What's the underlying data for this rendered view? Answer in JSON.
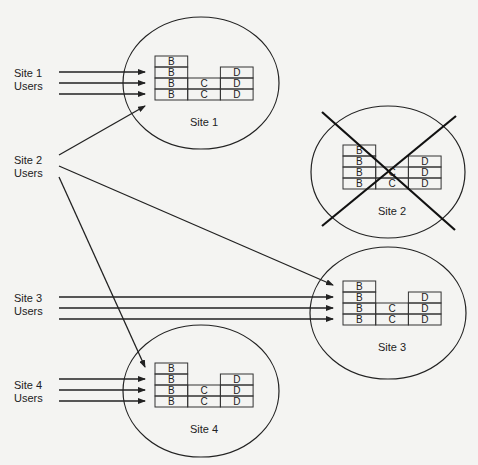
{
  "diagram": {
    "title": "",
    "sites": [
      {
        "id": "site1",
        "label": "Site 1",
        "cx": 201,
        "cy": 83,
        "rx": 78,
        "ry": 66,
        "bx": 155,
        "by": 56,
        "failed": false
      },
      {
        "id": "site2",
        "label": "Site 2",
        "cx": 388,
        "cy": 172,
        "rx": 77,
        "ry": 66,
        "bx": 343,
        "by": 145,
        "failed": true
      },
      {
        "id": "site3",
        "label": "Site 3",
        "cx": 388,
        "cy": 313,
        "rx": 78,
        "ry": 66,
        "bx": 343,
        "by": 281,
        "failed": false
      },
      {
        "id": "site4",
        "label": "Site 4",
        "cx": 201,
        "cy": 391,
        "rx": 78,
        "ry": 66,
        "bx": 155,
        "by": 363,
        "failed": false
      }
    ],
    "user_groups": [
      {
        "id": "users1",
        "line1": "Site 1",
        "line2": "Users",
        "x": 14,
        "y": 77
      },
      {
        "id": "users2",
        "line1": "Site 2",
        "line2": "Users",
        "x": 14,
        "y": 164
      },
      {
        "id": "users3",
        "line1": "Site 3",
        "line2": "Users",
        "x": 14,
        "y": 302
      },
      {
        "id": "users4",
        "line1": "Site 4",
        "line2": "Users",
        "x": 14,
        "y": 389
      }
    ],
    "columns": [
      {
        "letter": "B",
        "height": 4
      },
      {
        "letter": "C",
        "height": 2
      },
      {
        "letter": "D",
        "height": 3
      }
    ],
    "colors": {
      "stroke": "#222222",
      "background": "#f4f4f2"
    }
  }
}
